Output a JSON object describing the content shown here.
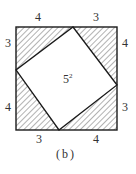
{
  "figure": {
    "caption": "(b)",
    "center_label": "5",
    "center_exponent": "2",
    "colors": {
      "stroke": "#1a1a1a",
      "hatch": "#555555",
      "text": "#333333",
      "background": "#ffffff"
    },
    "side_labels": {
      "top_left": "4",
      "top_right": "3",
      "right_top": "4",
      "right_bottom": "3",
      "bottom_left": "3",
      "bottom_right": "4",
      "left_top": "3",
      "left_bottom": "4"
    }
  }
}
